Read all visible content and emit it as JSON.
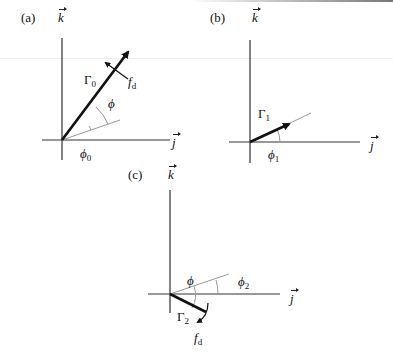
{
  "panels": [
    {
      "id": "a",
      "label": "(a)",
      "vertical_axis": "k",
      "horizontal_axis": "j",
      "vector_label": "Γ",
      "vector_sub": "0",
      "angle_labels": [
        {
          "symbol": "ϕ",
          "sub": ""
        },
        {
          "symbol": "ϕ",
          "sub": "0"
        }
      ],
      "force_label": "f",
      "force_sub": "d"
    },
    {
      "id": "b",
      "label": "(b)",
      "vertical_axis": "k",
      "horizontal_axis": "j",
      "vector_label": "Γ",
      "vector_sub": "1",
      "angle_labels": [
        {
          "symbol": "ϕ",
          "sub": "1"
        }
      ]
    },
    {
      "id": "c",
      "label": "(c)",
      "vertical_axis": "k",
      "horizontal_axis": "j",
      "vector_label": "Γ",
      "vector_sub": "2",
      "angle_labels": [
        {
          "symbol": "ϕ",
          "sub": ""
        },
        {
          "symbol": "ϕ",
          "sub": "2"
        }
      ],
      "force_label": "f",
      "force_sub": "d"
    }
  ]
}
